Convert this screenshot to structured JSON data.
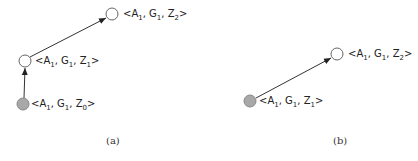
{
  "diagrams": [
    {
      "caption": "(a)",
      "nodes": [
        {
          "id": "a_z0",
          "label_parts": [
            "<A",
            "1",
            ", G",
            "1",
            ", Z",
            "0",
            ">"
          ],
          "filled": true
        },
        {
          "id": "a_z1",
          "label_parts": [
            "<A",
            "1",
            ", G",
            "1",
            ", Z",
            "1",
            ">"
          ],
          "filled": false
        },
        {
          "id": "a_z2",
          "label_parts": [
            "<A",
            "1",
            ", G",
            "1",
            ", Z",
            "2",
            ">"
          ],
          "filled": false
        }
      ],
      "edges": [
        {
          "from": "a_z0",
          "to": "a_z1"
        },
        {
          "from": "a_z1",
          "to": "a_z2"
        }
      ]
    },
    {
      "caption": "(b)",
      "nodes": [
        {
          "id": "b_z1",
          "label_parts": [
            "<A",
            "1",
            ", G",
            "1",
            ", Z",
            "1",
            ">"
          ],
          "filled": true
        },
        {
          "id": "b_z2",
          "label_parts": [
            "<A",
            "1",
            ", G",
            "1",
            ", Z",
            "2",
            ">"
          ],
          "filled": false
        }
      ],
      "edges": [
        {
          "from": "b_z1",
          "to": "b_z2"
        }
      ]
    }
  ],
  "colors": {
    "filled_node": "#a8a8a8",
    "empty_node": "#ffffff",
    "stroke": "#555555"
  }
}
